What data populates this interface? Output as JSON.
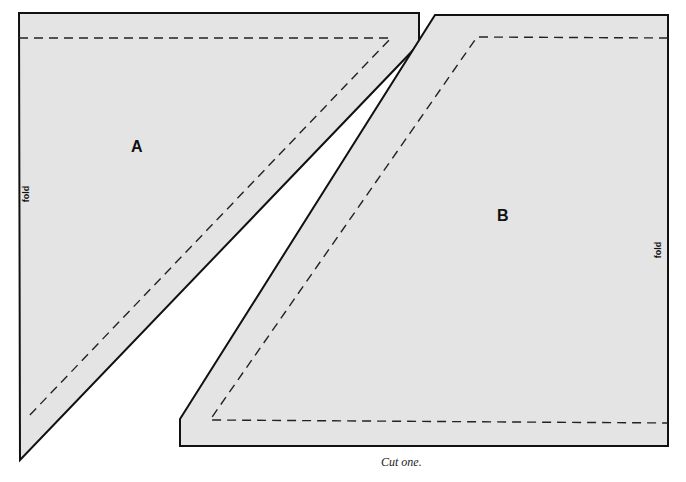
{
  "pieces": {
    "a": {
      "label": "A",
      "fold_label": "fold"
    },
    "b": {
      "label": "B",
      "fold_label": "fold"
    }
  },
  "caption": "Cut one.",
  "colors": {
    "fill": "#e4e4e4",
    "outline": "#111111"
  }
}
